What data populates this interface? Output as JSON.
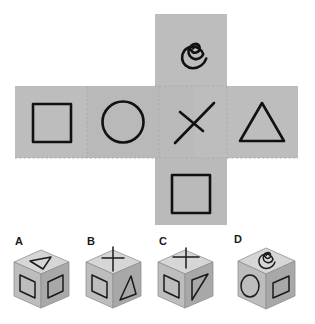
{
  "puzzle": {
    "title": "Cube net folding puzzle",
    "type": "spatial-reasoning-multiple-choice"
  },
  "colors": {
    "background": "#ffffff",
    "net_panel": "#bdbdbd",
    "net_panel_shade": "#b6b6b6",
    "fold_line": "#a9a9a9",
    "symbol_stroke": "#111111",
    "cube_top": "#d6d6d6",
    "cube_left": "#bdbdbd",
    "cube_right": "#a8a8a8",
    "cube_outline": "#8f8f8f",
    "label_text": "#1a1a1a"
  },
  "net": {
    "name": "cube-net",
    "layout": "cross",
    "cell_size": 72,
    "panels": [
      {
        "id": "panel-top",
        "symbol": "spiral",
        "row": 0,
        "col": 1
      },
      {
        "id": "panel-left",
        "symbol": "square",
        "row": 1,
        "col": 0
      },
      {
        "id": "panel-center-left",
        "symbol": "circle",
        "row": 1,
        "col": 1
      },
      {
        "id": "panel-center-right",
        "symbol": "cross-x",
        "row": 1,
        "col": 2
      },
      {
        "id": "panel-right",
        "symbol": "triangle",
        "row": 1,
        "col": 3
      },
      {
        "id": "panel-bottom",
        "symbol": "square",
        "row": 2,
        "col": 1
      }
    ],
    "symbol_names": {
      "spiral": "spiral-icon",
      "square": "square-icon",
      "circle": "circle-icon",
      "cross-x": "diagonal-cross-icon",
      "triangle": "triangle-icon"
    }
  },
  "options": [
    {
      "label": "A",
      "name": "option-a",
      "faces": {
        "top": "triangle",
        "left": "square",
        "right": "square"
      }
    },
    {
      "label": "B",
      "name": "option-b",
      "faces": {
        "top": "cross-x",
        "left": "square",
        "right": "triangle"
      }
    },
    {
      "label": "C",
      "name": "option-c",
      "faces": {
        "top": "cross-x",
        "left": "square",
        "right": "triangle"
      }
    },
    {
      "label": "D",
      "name": "option-d",
      "faces": {
        "top": "spiral",
        "left": "ellipse",
        "right": "square"
      }
    }
  ]
}
